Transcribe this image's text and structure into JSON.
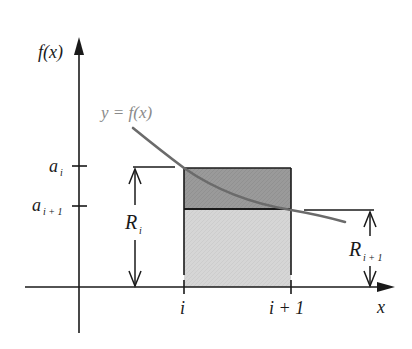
{
  "figure": {
    "y_axis_label": "f(x)",
    "x_axis_label": "x",
    "curve_label": "y = f(x)",
    "y_ticks": [
      {
        "base": "a",
        "sub": "i"
      },
      {
        "base": "a",
        "sub": "i + 1"
      }
    ],
    "x_ticks": [
      {
        "label": "i"
      },
      {
        "label": "i + 1"
      }
    ],
    "dimensions": [
      {
        "base": "R",
        "sub": "i"
      },
      {
        "base": "R",
        "sub": "i + 1"
      }
    ],
    "colors": {
      "axis": "#1a1a1a",
      "curve": "#6b6b6b",
      "upper_rect": "#9c9c9c",
      "lower_rect": "#d6d6d6"
    }
  }
}
